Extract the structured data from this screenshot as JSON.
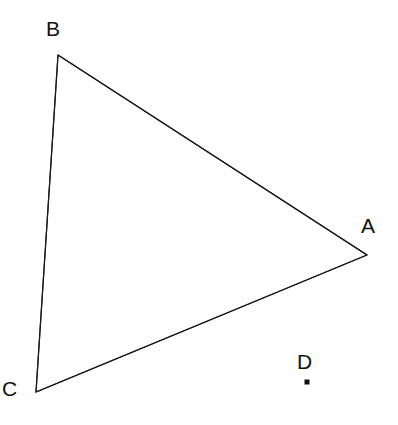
{
  "figure": {
    "kind": "geometry-diagram",
    "canvas": {
      "width": 398,
      "height": 425,
      "background": "#ffffff"
    },
    "style": {
      "stroke_color": "#1a1a1a",
      "stroke_width": 1.2,
      "label_color": "#111111",
      "label_font_size": 21,
      "point_marker_color": "#111111",
      "point_marker_size": 5
    },
    "points": [
      {
        "id": "A",
        "label": "A",
        "x": 367,
        "y": 255,
        "marker": false,
        "label_x": 361,
        "label_y": 215
      },
      {
        "id": "B",
        "label": "B",
        "x": 58,
        "y": 55,
        "marker": false,
        "label_x": 46,
        "label_y": 18
      },
      {
        "id": "C",
        "label": "C",
        "x": 36,
        "y": 392,
        "marker": false,
        "label_x": 2,
        "label_y": 378
      },
      {
        "id": "D",
        "label": "D",
        "x": 307,
        "y": 382,
        "marker": true,
        "label_x": 297,
        "label_y": 351
      }
    ],
    "polygon": {
      "name": "triangle-ABC",
      "vertex_ids": [
        "A",
        "B",
        "C"
      ],
      "points_attr": "58,55 367,255 36,392",
      "filled": false
    },
    "edges": [
      {
        "id": "BA",
        "from": "B",
        "to": "A",
        "x1": 58,
        "y1": 55,
        "x2": 367,
        "y2": 255
      },
      {
        "id": "AC",
        "from": "A",
        "to": "C",
        "x1": 367,
        "y1": 255,
        "x2": 36,
        "y2": 392
      },
      {
        "id": "CB",
        "from": "C",
        "to": "B",
        "x1": 36,
        "y1": 392,
        "x2": 58,
        "y2": 55
      }
    ],
    "marker_point": {
      "id": "D",
      "cx": 307,
      "cy": 382,
      "size": 5
    }
  }
}
